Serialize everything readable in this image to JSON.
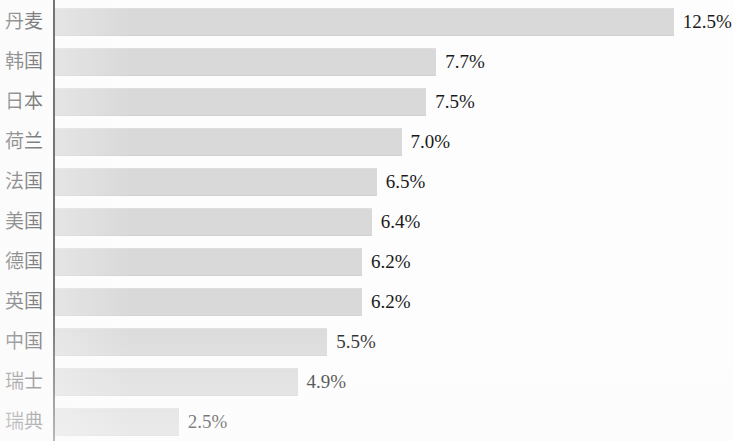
{
  "chart_data": {
    "type": "bar",
    "orientation": "horizontal",
    "title": "",
    "subtitle": "",
    "xlabel": "",
    "ylabel": "",
    "grid": false,
    "legend": null,
    "value_suffix": "%",
    "xlim": [
      0,
      13.5
    ],
    "axis": {
      "category_axis": "vertical-left-rule",
      "value_axis_visible": false,
      "tick_labels": []
    },
    "colors": {
      "bar_fill": "#d9d9d9",
      "axis_line": "#2b2b2b",
      "label_text": "#1d1d1d",
      "value_text": "#1a1a1a",
      "background": "#fdfdfd"
    },
    "categories": [
      "丹麦",
      "韩国",
      "日本",
      "荷兰",
      "法国",
      "美国",
      "德国",
      "英国",
      "中国",
      "瑞士",
      "瑞典"
    ],
    "values": [
      12.5,
      7.7,
      7.5,
      7.0,
      6.5,
      6.4,
      6.2,
      6.2,
      5.5,
      4.9,
      2.5
    ],
    "data_labels": [
      "12.5%",
      "7.7%",
      "7.5%",
      "7.0%",
      "6.5%",
      "6.4%",
      "6.2%",
      "6.2%",
      "5.5%",
      "4.9%",
      "2.5%"
    ],
    "points": [
      {
        "category": "丹麦",
        "value": 12.5,
        "label": "12.5%"
      },
      {
        "category": "韩国",
        "value": 7.7,
        "label": "7.7%"
      },
      {
        "category": "日本",
        "value": 7.5,
        "label": "7.5%"
      },
      {
        "category": "荷兰",
        "value": 7.0,
        "label": "7.0%"
      },
      {
        "category": "法国",
        "value": 6.5,
        "label": "6.5%"
      },
      {
        "category": "美国",
        "value": 6.4,
        "label": "6.4%"
      },
      {
        "category": "德国",
        "value": 6.2,
        "label": "6.2%"
      },
      {
        "category": "英国",
        "value": 6.2,
        "label": "6.2%"
      },
      {
        "category": "中国",
        "value": 5.5,
        "label": "5.5%"
      },
      {
        "category": "瑞士",
        "value": 4.9,
        "label": "4.9%"
      },
      {
        "category": "瑞典",
        "value": 2.5,
        "label": "2.5%"
      }
    ]
  }
}
